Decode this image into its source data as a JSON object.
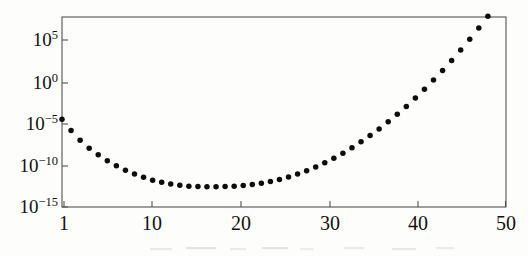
{
  "figure": {
    "background_color": "#fdfdfc",
    "ink_color": "#111110",
    "frame_color": "#55534f",
    "marker_color": "#0d0d0c"
  },
  "chart_data": {
    "type": "scatter",
    "title": "",
    "subtitle": "",
    "xlabel": "",
    "ylabel": "",
    "xscale": "linear",
    "yscale": "log",
    "grid": false,
    "legend": null,
    "frame": "box",
    "marker": "filled-circle",
    "marker_size_px": 5.5,
    "xlim": [
      1,
      50
    ],
    "ylim": [
      1e-15,
      10000000.0
    ],
    "xticks": [
      1,
      10,
      20,
      30,
      40,
      50
    ],
    "xtick_labels": [
      "1",
      "10",
      "20",
      "30",
      "40",
      "50"
    ],
    "yticks": [
      100000.0,
      1,
      1e-05,
      1e-10,
      1e-15
    ],
    "ytick_labels": [
      "10⁵5",
      "10⁵0",
      "10⁵−5",
      "10−¹10",
      "10−¹15"
    ],
    "ytick_mantissa": [
      "10",
      "10",
      "10",
      "10",
      "10"
    ],
    "ytick_exponents": [
      "5",
      "0",
      "−5",
      "−10",
      "−15"
    ],
    "x": [
      1,
      2,
      3,
      4,
      5,
      6,
      7,
      8,
      9,
      10,
      11,
      12,
      13,
      14,
      15,
      16,
      17,
      18,
      19,
      20,
      21,
      22,
      23,
      24,
      25,
      26,
      27,
      28,
      29,
      30,
      31,
      32,
      33,
      34,
      35,
      36,
      37,
      38,
      39,
      40,
      41,
      42,
      43,
      44,
      45,
      46,
      47,
      48,
      49,
      50
    ],
    "y_log10": [
      -4.5,
      -5.85,
      -7.0,
      -7.95,
      -8.75,
      -9.45,
      -10.05,
      -10.6,
      -11.05,
      -11.45,
      -11.8,
      -12.05,
      -12.25,
      -12.4,
      -12.5,
      -12.55,
      -12.58,
      -12.58,
      -12.55,
      -12.5,
      -12.42,
      -12.3,
      -12.15,
      -11.95,
      -11.7,
      -11.4,
      -11.05,
      -10.65,
      -10.2,
      -9.7,
      -9.15,
      -8.55,
      -7.9,
      -7.2,
      -6.45,
      -5.65,
      -4.8,
      -3.9,
      -2.95,
      -1.95,
      -0.9,
      0.2,
      1.35,
      2.55,
      3.8,
      5.1,
      6.45,
      7.85,
      9.3,
      10.8
    ],
    "y": [
      3.16e-05,
      1.41e-06,
      1e-07,
      1.12e-08,
      1.78e-09,
      3.55e-10,
      8.91e-11,
      2.51e-11,
      8.91e-12,
      3.55e-12,
      1.58e-12,
      8.91e-13,
      5.62e-13,
      3.98e-13,
      3.16e-13,
      2.82e-13,
      2.63e-13,
      2.63e-13,
      2.82e-13,
      3.16e-13,
      3.8e-13,
      5.01e-13,
      7.08e-13,
      1.12e-12,
      2e-12,
      3.98e-12,
      8.91e-12,
      2.24e-11,
      6.31e-11,
      2e-10,
      7.08e-10,
      2.82e-09,
      1.26e-08,
      6.31e-08,
      3.55e-07,
      2.24e-06,
      1.58e-05,
      0.000126,
      0.00112,
      0.0112,
      0.126,
      1.58,
      22.4,
      355.0,
      6310.0,
      126000.0,
      2820000.0,
      70800000.0,
      2000000000.0,
      63100000000.0
    ],
    "n_points": 50,
    "annotations": []
  },
  "geometry": {
    "plot_left": 62,
    "plot_right": 506,
    "plot_top": 17,
    "plot_bottom": 207,
    "ytick_pixels": [
      40,
      83,
      124,
      166,
      207
    ],
    "xtick_pixels": [
      64,
      152,
      241,
      330,
      418,
      506
    ]
  }
}
